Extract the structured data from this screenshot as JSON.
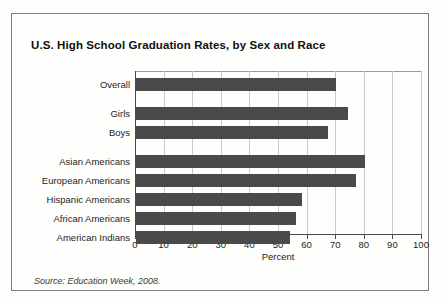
{
  "figure": {
    "title": "U.S. High School Graduation Rates, by Sex and Race",
    "source_note": "Source: Education Week, 2008."
  },
  "chart_data": {
    "type": "bar",
    "orientation": "horizontal",
    "title": "U.S. High School Graduation Rates, by Sex and Race",
    "xlabel": "Percent",
    "ylabel": "",
    "xlim": [
      0,
      100
    ],
    "xticks": [
      0,
      10,
      20,
      30,
      40,
      50,
      60,
      70,
      80,
      90,
      100
    ],
    "grid": true,
    "legend": "none",
    "bar_color": "#4a4a4a",
    "categories": [
      "Overall",
      "Girls",
      "Boys",
      "Asian Americans",
      "European Americans",
      "Hispanic Americans",
      "African Americans",
      "American Indians"
    ],
    "values": [
      70,
      74,
      67,
      80,
      77,
      58,
      56,
      54
    ],
    "group_gaps_after": [
      "Overall",
      "Boys"
    ]
  }
}
